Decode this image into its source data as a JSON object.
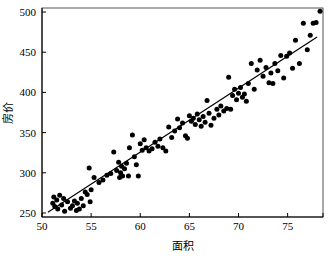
{
  "chart_data": {
    "type": "scatter",
    "title": "",
    "xlabel": "面积",
    "ylabel": "房价",
    "xlim": [
      50,
      78.6
    ],
    "ylim": [
      245,
      505
    ],
    "grid": false,
    "legend": null,
    "xticks": [
      50,
      55,
      60,
      65,
      70,
      75
    ],
    "yticks": [
      250,
      300,
      350,
      400,
      450,
      500
    ],
    "xtick_labels": [
      "50",
      "55",
      "60",
      "65",
      "70",
      "75"
    ],
    "ytick_labels": [
      "250",
      "300",
      "350",
      "400",
      "450",
      "500"
    ],
    "series": [
      {
        "name": "房价-面积散点",
        "marker": "filled-circle",
        "color": "#000000",
        "points": [
          [
            51.1,
            262
          ],
          [
            51.2,
            270
          ],
          [
            51.3,
            258
          ],
          [
            51.5,
            266
          ],
          [
            51.6,
            255
          ],
          [
            51.8,
            272
          ],
          [
            52.0,
            260
          ],
          [
            52.2,
            268
          ],
          [
            52.3,
            252
          ],
          [
            52.6,
            264
          ],
          [
            52.9,
            256
          ],
          [
            53.1,
            259
          ],
          [
            53.3,
            265
          ],
          [
            53.5,
            253
          ],
          [
            53.6,
            262
          ],
          [
            53.8,
            255
          ],
          [
            54.0,
            268
          ],
          [
            54.2,
            259
          ],
          [
            54.4,
            276
          ],
          [
            54.6,
            273
          ],
          [
            54.8,
            306
          ],
          [
            54.9,
            264
          ],
          [
            55.0,
            279
          ],
          [
            55.3,
            294
          ],
          [
            55.8,
            288
          ],
          [
            56.2,
            291
          ],
          [
            56.6,
            297
          ],
          [
            57.0,
            299
          ],
          [
            57.3,
            326
          ],
          [
            57.6,
            303
          ],
          [
            57.8,
            313
          ],
          [
            57.9,
            294
          ],
          [
            58.0,
            300
          ],
          [
            58.1,
            308
          ],
          [
            58.2,
            296
          ],
          [
            58.4,
            305
          ],
          [
            58.6,
            312
          ],
          [
            58.8,
            296
          ],
          [
            58.9,
            331
          ],
          [
            59.2,
            347
          ],
          [
            59.4,
            320
          ],
          [
            59.6,
            310
          ],
          [
            59.8,
            296
          ],
          [
            60.0,
            336
          ],
          [
            60.2,
            328
          ],
          [
            60.4,
            341
          ],
          [
            60.6,
            331
          ],
          [
            60.9,
            327
          ],
          [
            61.2,
            330
          ],
          [
            61.5,
            338
          ],
          [
            61.8,
            333
          ],
          [
            62.0,
            342
          ],
          [
            62.3,
            331
          ],
          [
            62.6,
            327
          ],
          [
            62.9,
            357
          ],
          [
            63.2,
            344
          ],
          [
            63.5,
            352
          ],
          [
            63.8,
            367
          ],
          [
            64.0,
            356
          ],
          [
            64.3,
            362
          ],
          [
            64.6,
            346
          ],
          [
            64.8,
            343
          ],
          [
            65.0,
            371
          ],
          [
            65.2,
            364
          ],
          [
            65.4,
            368
          ],
          [
            65.6,
            360
          ],
          [
            65.8,
            373
          ],
          [
            66.0,
            366
          ],
          [
            66.2,
            358
          ],
          [
            66.4,
            370
          ],
          [
            66.6,
            363
          ],
          [
            66.8,
            390
          ],
          [
            67.0,
            374
          ],
          [
            67.2,
            359
          ],
          [
            67.5,
            368
          ],
          [
            67.8,
            379
          ],
          [
            68.0,
            372
          ],
          [
            68.2,
            383
          ],
          [
            68.5,
            377
          ],
          [
            68.8,
            380
          ],
          [
            69.0,
            419
          ],
          [
            69.2,
            379
          ],
          [
            69.4,
            396
          ],
          [
            69.6,
            404
          ],
          [
            69.8,
            391
          ],
          [
            70.0,
            399
          ],
          [
            70.2,
            406
          ],
          [
            70.4,
            394
          ],
          [
            70.6,
            398
          ],
          [
            70.8,
            389
          ],
          [
            71.0,
            411
          ],
          [
            71.3,
            436
          ],
          [
            71.6,
            404
          ],
          [
            71.9,
            428
          ],
          [
            72.2,
            440
          ],
          [
            72.5,
            420
          ],
          [
            72.8,
            431
          ],
          [
            73.1,
            412
          ],
          [
            73.3,
            424
          ],
          [
            73.5,
            411
          ],
          [
            73.7,
            436
          ],
          [
            74.0,
            427
          ],
          [
            74.3,
            446
          ],
          [
            74.6,
            418
          ],
          [
            74.9,
            445
          ],
          [
            75.2,
            449
          ],
          [
            75.5,
            430
          ],
          [
            75.8,
            465
          ],
          [
            76.2,
            436
          ],
          [
            76.6,
            486
          ],
          [
            77.0,
            453
          ],
          [
            77.3,
            471
          ],
          [
            77.6,
            486
          ],
          [
            77.9,
            487
          ],
          [
            78.3,
            501
          ]
        ]
      }
    ],
    "fit_line": {
      "name": "回归直线",
      "x_start": 50.6,
      "y_start": 251,
      "x_end": 78.0,
      "y_end": 469
    }
  }
}
